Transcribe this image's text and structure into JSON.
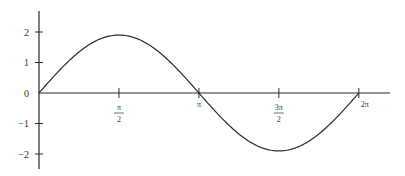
{
  "chart_data": {
    "type": "line",
    "title": "",
    "xlabel": "",
    "ylabel": "",
    "function": "y = 1.9 sin(x)",
    "x_ticks": [
      {
        "value": 1.5708,
        "label": "π/2",
        "num": "π",
        "den": "2"
      },
      {
        "value": 3.1416,
        "label": "π",
        "num": "π",
        "den": ""
      },
      {
        "value": 4.7124,
        "label": "3π/2",
        "num": "3π",
        "den": "2"
      },
      {
        "value": 6.2832,
        "label": "2π",
        "num": "2π",
        "den": ""
      }
    ],
    "y_ticks": [
      {
        "value": 2,
        "label": "2"
      },
      {
        "value": 1,
        "label": "1"
      },
      {
        "value": 0,
        "label": "0"
      },
      {
        "value": -1,
        "label": "−1"
      },
      {
        "value": -2,
        "label": "−2"
      }
    ],
    "xlim": [
      0,
      6.9
    ],
    "ylim": [
      -2.5,
      2.7
    ],
    "grid": false,
    "legend": null,
    "series": [
      {
        "name": "sine curve",
        "amplitude": 1.9,
        "x": [
          0,
          0.7854,
          1.5708,
          2.3562,
          3.1416,
          3.927,
          4.7124,
          5.4978,
          6.2832
        ],
        "values": [
          0,
          1.34,
          1.9,
          1.34,
          0,
          -1.34,
          -1.9,
          -1.34,
          0
        ]
      }
    ]
  },
  "layout": {
    "origin_px": [
      39,
      93
    ],
    "x_scale_px_per_unit": 50.9,
    "y_scale_px_per_unit": 30.5,
    "x_axis_end_px": 390,
    "y_axis_top_px": 11,
    "y_axis_bottom_px": 169,
    "line_color": "#2a2a2a"
  }
}
